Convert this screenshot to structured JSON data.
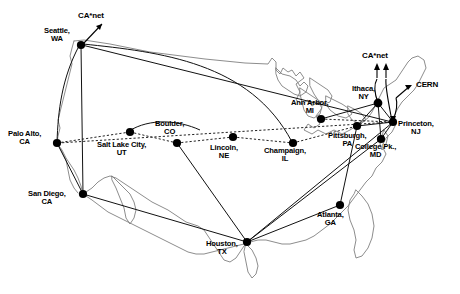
{
  "figure": {
    "background_color": "#ffffff",
    "line_color": "#111111",
    "map_outline_color": "#808080",
    "node_color": "#000000",
    "width": 460,
    "height": 294
  },
  "nodes": [
    {
      "id": "seattle",
      "label": "Seattle,\nWA",
      "x": 81,
      "y": 45,
      "label_x": 44,
      "label_y": 28
    },
    {
      "id": "palo_alto",
      "label": "Palo Alto,\nCA",
      "x": 57,
      "y": 143,
      "label_x": 9,
      "label_y": 130
    },
    {
      "id": "san_diego",
      "label": "San Diego,\nCA",
      "x": 83,
      "y": 194,
      "label_x": 28,
      "label_y": 190
    },
    {
      "id": "salt_lake",
      "label": "Salt Lake City,\nUT",
      "x": 130,
      "y": 132,
      "label_x": 99,
      "label_y": 142
    },
    {
      "id": "boulder",
      "label": "Boulder,\nCO",
      "x": 177,
      "y": 143,
      "label_x": 156,
      "label_y": 121
    },
    {
      "id": "lincoln",
      "label": "Lincoln,\nNE",
      "x": 233,
      "y": 137,
      "label_x": 210,
      "label_y": 144
    },
    {
      "id": "champaign",
      "label": "Champaign,\nIL",
      "x": 293,
      "y": 143,
      "label_x": 265,
      "label_y": 147
    },
    {
      "id": "houston",
      "label": "Houston,\nTX",
      "x": 247,
      "y": 242,
      "label_x": 208,
      "label_y": 241
    },
    {
      "id": "ann_arbor",
      "label": "Ann Arbor,\nMI",
      "x": 321,
      "y": 119,
      "label_x": 293,
      "label_y": 100
    },
    {
      "id": "ithaca",
      "label": "Ithaca,\nNY",
      "x": 378,
      "y": 103,
      "label_x": 353,
      "label_y": 86
    },
    {
      "id": "pittsburgh",
      "label": "Pittsburgh,\nPA",
      "x": 357,
      "y": 126,
      "label_x": 330,
      "label_y": 133
    },
    {
      "id": "princeton",
      "label": "Princeton,\nNJ",
      "x": 393,
      "y": 122,
      "label_x": 399,
      "label_y": 121
    },
    {
      "id": "college_pk",
      "label": "College Pk.,\nMD",
      "x": 381,
      "y": 139,
      "label_x": 357,
      "label_y": 144
    },
    {
      "id": "atlanta",
      "label": "Atlanta,\nGA",
      "x": 340,
      "y": 205,
      "label_x": 318,
      "label_y": 212
    }
  ],
  "external_labels": [
    {
      "id": "canet_west",
      "label": "CA*net",
      "x": 78,
      "y": 14
    },
    {
      "id": "canet_east",
      "label": "CA*net",
      "x": 363,
      "y": 54
    },
    {
      "id": "cern",
      "label": "CERN",
      "x": 418,
      "y": 84
    }
  ],
  "links": [
    {
      "from": "seattle",
      "to": "san_diego",
      "style": "solid"
    },
    {
      "from": "seattle",
      "to": "palo_alto",
      "style": "curve"
    },
    {
      "from": "seattle",
      "to": "princeton",
      "style": "solid"
    },
    {
      "from": "seattle",
      "to": "champaign",
      "style": "solid"
    },
    {
      "from": "palo_alto",
      "to": "san_diego",
      "style": "solid"
    },
    {
      "from": "palo_alto",
      "to": "salt_lake",
      "style": "dashed"
    },
    {
      "from": "salt_lake",
      "to": "boulder",
      "style": "dashed"
    },
    {
      "from": "boulder",
      "to": "lincoln",
      "style": "dashed"
    },
    {
      "from": "lincoln",
      "to": "champaign",
      "style": "dashed"
    },
    {
      "from": "champaign",
      "to": "pittsburgh",
      "style": "dashed"
    },
    {
      "from": "boulder",
      "to": "houston",
      "style": "solid"
    },
    {
      "from": "san_diego",
      "to": "houston",
      "style": "solid"
    },
    {
      "from": "houston",
      "to": "atlanta",
      "style": "solid"
    },
    {
      "from": "houston",
      "to": "college_pk",
      "style": "solid"
    },
    {
      "from": "houston",
      "to": "princeton",
      "style": "solid"
    },
    {
      "from": "atlanta",
      "to": "pittsburgh",
      "style": "solid"
    },
    {
      "from": "ann_arbor",
      "to": "ithaca",
      "style": "solid"
    },
    {
      "from": "ann_arbor",
      "to": "princeton",
      "style": "dashed"
    },
    {
      "from": "ithaca",
      "to": "pittsburgh",
      "style": "solid"
    },
    {
      "from": "ithaca",
      "to": "princeton",
      "style": "solid"
    },
    {
      "from": "ithaca",
      "to": "college_pk",
      "style": "solid"
    },
    {
      "from": "pittsburgh",
      "to": "princeton",
      "style": "solid"
    },
    {
      "from": "princeton",
      "to": "college_pk",
      "style": "solid"
    },
    {
      "from": "palo_alto",
      "to": "princeton",
      "style": "dashed"
    }
  ],
  "external_arrows": [
    {
      "id": "arrow-canet-west",
      "from_x": 81,
      "from_y": 45,
      "to_x": 103,
      "to_y": 23
    },
    {
      "id": "arrow-canet-east-a",
      "from_x": 377,
      "from_y": 77,
      "to_x": 377,
      "to_y": 63
    },
    {
      "id": "arrow-canet-east-b",
      "from_x": 386,
      "from_y": 77,
      "to_x": 386,
      "to_y": 63
    },
    {
      "id": "arrow-cern",
      "from_x": 398,
      "from_y": 96,
      "to_x": 411,
      "to_y": 86
    }
  ]
}
